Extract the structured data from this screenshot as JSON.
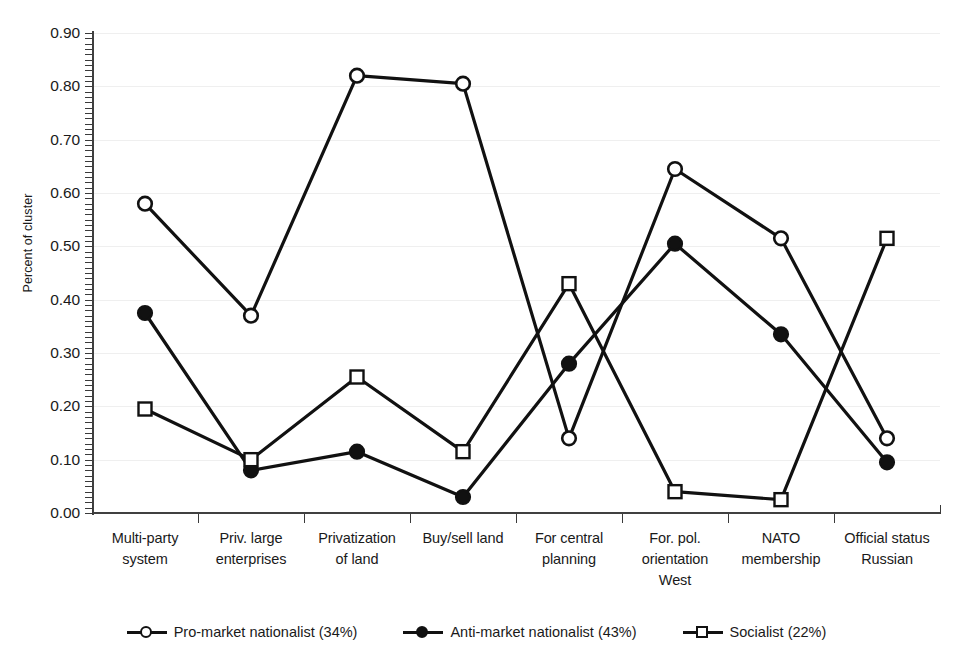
{
  "chart_data": {
    "type": "line",
    "title": "",
    "xlabel": "",
    "ylabel": "Percent of cluster",
    "ylim": [
      0.0,
      0.9
    ],
    "ytick_labels": [
      "0.00",
      "0.10",
      "0.20",
      "0.30",
      "0.40",
      "0.50",
      "0.60",
      "0.70",
      "0.80",
      "0.90"
    ],
    "ytick_values": [
      0.0,
      0.1,
      0.2,
      0.3,
      0.4,
      0.5,
      0.6,
      0.7,
      0.8,
      0.9
    ],
    "grid": true,
    "legend_position": "bottom",
    "categories": [
      "Multi-party system",
      "Priv. large enterprises",
      "Privatization of land",
      "Buy/sell land",
      "For central planning",
      "For. pol. orientation West",
      "NATO membership",
      "Official status Russian"
    ],
    "category_lines": [
      [
        "Multi-party",
        "system"
      ],
      [
        "Priv. large",
        "enterprises"
      ],
      [
        "Privatization",
        "of land"
      ],
      [
        "Buy/sell land"
      ],
      [
        "For central",
        "planning"
      ],
      [
        "For. pol.",
        "orientation",
        "West"
      ],
      [
        "NATO",
        "membership"
      ],
      [
        "Official status",
        "Russian"
      ]
    ],
    "series": [
      {
        "name": "Pro-market nationalist (34%)",
        "marker": "open-circle",
        "color": "#111111",
        "values": [
          0.58,
          0.37,
          0.82,
          0.805,
          0.14,
          0.645,
          0.515,
          0.14
        ]
      },
      {
        "name": "Anti-market nationalist (43%)",
        "marker": "filled-circle",
        "color": "#111111",
        "values": [
          0.375,
          0.08,
          0.115,
          0.03,
          0.28,
          0.505,
          0.335,
          0.095
        ]
      },
      {
        "name": "Socialist (22%)",
        "marker": "open-square",
        "color": "#111111",
        "values": [
          0.195,
          0.1,
          0.255,
          0.115,
          0.43,
          0.04,
          0.025,
          0.515
        ]
      }
    ]
  },
  "legend": {
    "items": [
      {
        "label": "Pro-market nationalist (34%)",
        "marker": "open-circle"
      },
      {
        "label": "Anti-market nationalist (43%)",
        "marker": "filled-circle"
      },
      {
        "label": "Socialist (22%)",
        "marker": "open-square"
      }
    ]
  }
}
